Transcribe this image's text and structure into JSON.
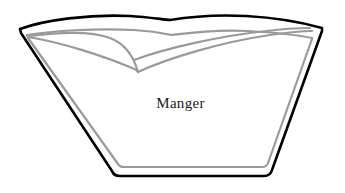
{
  "figure": {
    "name": "manger",
    "label": "Manger",
    "background_color": "#ffffff",
    "outline_color": "#000000",
    "inner_line_color": "#9a9a9a",
    "label_color": "#1a1a1a",
    "width": 345,
    "height": 193
  },
  "shapes": {
    "outer_outline": {
      "name": "manger-outer-outline",
      "description": "trapezoidal trough body with dipped top edge",
      "color": "#000000",
      "stroke_width": 2.6,
      "path": "M 20 29 C 44 20 90 14 130 16 C 146 17 160 19 170 20 C 182 18 210 14 246 16 C 282 18 308 24 322 28 L 322 31 L 272 170 C 271 174 268 176 264 176 L 120 176 C 116 176 113 174 112 171 L 21 33 Z"
    },
    "inner_outline": {
      "name": "manger-inner-outline",
      "color": "#9a9a9a",
      "stroke_width": 2.2,
      "path": "M 27 35 C 52 31 96 28 134 30 C 150 31 162 33 172 35 C 188 33 214 29 248 31 C 282 33 302 36 312 38 L 312 39 L 268 163 C 267 166 265 167 262 167 L 124 167 C 121 167 119 166 118 164 L 28 38 Z"
    },
    "rim_curve_upper": {
      "name": "manger-rim-upper-curve",
      "description": "gray arc sweeping from left rim up and over to the centre V",
      "color": "#9a9a9a",
      "stroke_width": 2.2,
      "path": "M 30 36 C 56 33 88 30 110 38 C 126 44 134 58 138 72"
    },
    "rim_curve_lower": {
      "name": "manger-rim-lower-curve",
      "description": "gray line from left rim sweeping right to the centre V point",
      "color": "#9a9a9a",
      "stroke_width": 2.2,
      "path": "M 28 37 C 60 42 104 56 132 68 C 135 69 137 70 138 72"
    },
    "rim_curve_right": {
      "name": "manger-rim-right-curve",
      "description": "gray curve from the centre V rising to the right rim",
      "color": "#9a9a9a",
      "stroke_width": 2.2,
      "path": "M 138 72 C 168 58 222 42 270 35 C 292 32 306 31 312 31"
    },
    "rim_curve_right_inner": {
      "name": "manger-rim-right-inner-curve",
      "description": "second gray curve slightly above the right rim curve",
      "color": "#9a9a9a",
      "stroke_width": 2.2,
      "path": "M 134 60 C 166 48 220 36 266 31 C 290 28 304 28 310 28"
    }
  }
}
